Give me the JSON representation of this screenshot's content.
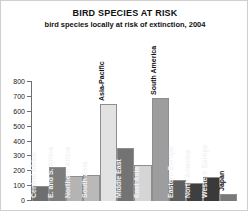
{
  "chart_data": {
    "type": "bar",
    "title": "BIRD SPECIES AT RISK",
    "subtitle": "bird species locally at risk of extinction, 2004",
    "xlabel": "",
    "ylabel": "",
    "ylim": [
      0,
      800
    ],
    "yticks": [
      0,
      100,
      200,
      300,
      400,
      500,
      600,
      700,
      800
    ],
    "grid": false,
    "legend": "none",
    "categories": [
      "Central Africa",
      "E. and S. Africa",
      "Northern Africa",
      "South Asia",
      "Asia-Pacific",
      "Middle East",
      "East Asia",
      "South America",
      "Eastern Europe",
      "North America",
      "Western Europe",
      "Japan"
    ],
    "values": [
      100,
      230,
      165,
      175,
      650,
      355,
      240,
      690,
      140,
      120,
      160,
      45
    ],
    "bar_colors": [
      "#6e6e6e",
      "#7d7d7d",
      "#b4b4b4",
      "#b9b9b9",
      "#e2e2e2",
      "#737373",
      "#d5d5d5",
      "#9d9d9d",
      "#5e5e5e",
      "#3f3f3f",
      "#3a3a3a",
      "#7a7a7a"
    ],
    "label_placement": [
      "inside",
      "inside",
      "inside",
      "inside",
      "outside",
      "inside",
      "inside",
      "outside",
      "inside",
      "inside",
      "inside",
      "outside"
    ]
  }
}
